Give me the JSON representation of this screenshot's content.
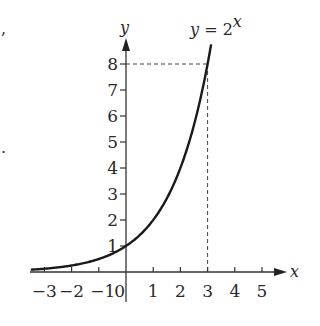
{
  "chart_data": {
    "type": "line",
    "function": "2^x",
    "xlabel": "x",
    "ylabel": "y",
    "xlim": [
      -3.5,
      6
    ],
    "ylim": [
      0,
      9
    ],
    "x_ticks": [
      -3,
      -2,
      -1,
      0,
      1,
      2,
      3,
      4,
      5
    ],
    "x_tick_labels": [
      "−3",
      "−2",
      "−1",
      "0",
      "1",
      "2",
      "3",
      "4",
      "5"
    ],
    "y_ticks": [
      1,
      2,
      3,
      4,
      5,
      6,
      7,
      8
    ],
    "y_tick_labels": [
      "1",
      "2",
      "3",
      "4",
      "5",
      "6",
      "7",
      "8"
    ],
    "series": [
      {
        "name": "y = 2^x",
        "x": [
          -3.5,
          -3,
          -2,
          -1,
          0,
          1,
          2,
          3,
          3.13
        ],
        "y": [
          0.088,
          0.125,
          0.25,
          0.5,
          1,
          2,
          4,
          8,
          8.75
        ]
      }
    ],
    "annotations": [
      {
        "type": "dashed-guide",
        "point": [
          3,
          8
        ],
        "description": "dashed lines from (3,8) to both axes"
      }
    ],
    "grid": false,
    "legend": "none"
  },
  "labels": {
    "title_prefix": "y = 2",
    "title_exponent": "x",
    "x_axis": "x",
    "y_axis": "y"
  },
  "artifacts": {
    "top_left_mark": ",",
    "mid_left_mark": "."
  }
}
